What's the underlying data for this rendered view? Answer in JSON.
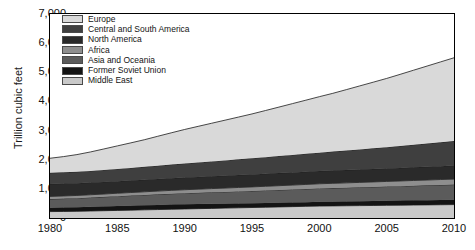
{
  "chart_data": {
    "type": "area",
    "stacked": true,
    "title": "",
    "xlabel": "",
    "ylabel": "Trillion cubic feet",
    "xlim": [
      1980,
      2010
    ],
    "ylim": [
      0,
      7000
    ],
    "grid": false,
    "legend_position": "top-left-inside",
    "y_ticks": [
      "0",
      "1,000",
      "2,000",
      "3,000",
      "4,000",
      "5,000",
      "6,000",
      "7,000"
    ],
    "y_tick_values": [
      0,
      1000,
      2000,
      3000,
      4000,
      5000,
      6000,
      7000
    ],
    "x_ticks": [
      "1980",
      "1985",
      "1990",
      "1995",
      "2000",
      "2005",
      "2010"
    ],
    "x_tick_values": [
      1980,
      1985,
      1990,
      1995,
      2000,
      2005,
      2010
    ],
    "x": [
      1980,
      1981,
      1982,
      1983,
      1984,
      1985,
      1986,
      1987,
      1988,
      1989,
      1990,
      1991,
      1992,
      1993,
      1994,
      1995,
      1996,
      1997,
      1998,
      1999,
      2000,
      2001,
      2002,
      2003,
      2004,
      2005,
      2006,
      2007,
      2008,
      2009,
      2010
    ],
    "series": [
      {
        "name": "Middle East",
        "color": "#c9c9c9",
        "values": [
          220,
          225,
          230,
          240,
          250,
          260,
          270,
          280,
          290,
          300,
          310,
          320,
          330,
          340,
          350,
          360,
          370,
          380,
          390,
          400,
          410,
          415,
          420,
          425,
          430,
          435,
          440,
          445,
          450,
          455,
          460
        ]
      },
      {
        "name": "Former Soviet Union",
        "color": "#141414",
        "values": [
          130,
          135,
          138,
          142,
          145,
          150,
          152,
          155,
          158,
          160,
          160,
          158,
          155,
          152,
          150,
          148,
          146,
          145,
          144,
          144,
          145,
          146,
          148,
          150,
          152,
          155,
          157,
          160,
          162,
          164,
          166
        ]
      },
      {
        "name": "Asia and Oceania",
        "color": "#5b5b5b",
        "values": [
          300,
          305,
          312,
          320,
          330,
          340,
          348,
          356,
          364,
          372,
          380,
          388,
          396,
          404,
          412,
          420,
          428,
          436,
          444,
          452,
          460,
          466,
          472,
          478,
          484,
          490,
          496,
          502,
          508,
          514,
          520
        ]
      },
      {
        "name": "Africa",
        "color": "#8e8e8e",
        "values": [
          90,
          92,
          94,
          96,
          98,
          100,
          104,
          108,
          112,
          116,
          120,
          124,
          128,
          132,
          136,
          140,
          144,
          148,
          152,
          156,
          160,
          163,
          166,
          169,
          172,
          175,
          178,
          181,
          184,
          187,
          190
        ]
      },
      {
        "name": "North America",
        "color": "#2a2a2a",
        "values": [
          430,
          425,
          420,
          418,
          416,
          414,
          412,
          412,
          414,
          416,
          418,
          420,
          422,
          424,
          426,
          428,
          430,
          432,
          434,
          436,
          438,
          438,
          438,
          440,
          442,
          444,
          446,
          450,
          454,
          458,
          462
        ]
      },
      {
        "name": "Central and South America",
        "color": "#3f3f3f",
        "values": [
          380,
          385,
          392,
          400,
          410,
          420,
          432,
          444,
          456,
          468,
          480,
          495,
          510,
          525,
          540,
          555,
          570,
          585,
          600,
          615,
          630,
          650,
          670,
          690,
          710,
          730,
          752,
          774,
          796,
          818,
          840
        ]
      },
      {
        "name": "Europe",
        "color": "#d9d9d9",
        "values": [
          500,
          540,
          590,
          650,
          720,
          790,
          860,
          930,
          1010,
          1090,
          1170,
          1240,
          1310,
          1380,
          1450,
          1520,
          1600,
          1680,
          1760,
          1840,
          1920,
          2000,
          2090,
          2180,
          2270,
          2360,
          2460,
          2560,
          2660,
          2760,
          2860
        ]
      }
    ],
    "totals": [
      2050,
      2107,
      2176,
      2266,
      2369,
      2474,
      2578,
      2685,
      2804,
      2922,
      3038,
      3145,
      3251,
      3357,
      3464,
      3571,
      3688,
      3806,
      3924,
      4043,
      4163,
      4278,
      4404,
      4532,
      4662,
      4789,
      4929,
      5072,
      5214,
      5356,
      5498
    ]
  },
  "legend": {
    "items": [
      {
        "label": "Europe",
        "color": "#d9d9d9"
      },
      {
        "label": "Central and South America",
        "color": "#3f3f3f"
      },
      {
        "label": "North America",
        "color": "#2a2a2a"
      },
      {
        "label": "Africa",
        "color": "#8e8e8e"
      },
      {
        "label": "Asia and Oceania",
        "color": "#5b5b5b"
      },
      {
        "label": "Former Soviet Union",
        "color": "#141414"
      },
      {
        "label": "Middle East",
        "color": "#c9c9c9"
      }
    ]
  },
  "axis": {
    "y_title": "Trillion cubic feet"
  }
}
